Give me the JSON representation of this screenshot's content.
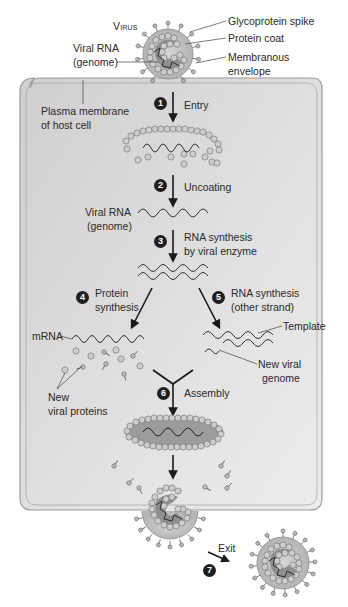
{
  "colors": {
    "cell_fill": "#d9d9d9",
    "cell_border": "#8e8e8e",
    "capsomere": "#c9c9c9",
    "capsomere_edge": "#7a7a7a",
    "envelope": "#bdbdbd",
    "core": "#8f8f8f",
    "arrow": "#1a1a1a",
    "badge": "#1f1f1f"
  },
  "virus_labels": {
    "virus": "Virus",
    "glycoprotein_spike": "Glycoprotein spike",
    "protein_coat": "Protein coat",
    "viral_rna_line1": "Viral RNA",
    "viral_rna_line2": "(genome)",
    "membranous_envelope_line1": "Membranous",
    "membranous_envelope_line2": "envelope"
  },
  "cell_labels": {
    "plasma_membrane_line1": "Plasma membrane",
    "plasma_membrane_line2": "of host cell"
  },
  "steps": [
    {
      "num": "1",
      "label_line1": "Entry",
      "label_line2": ""
    },
    {
      "num": "2",
      "label_line1": "Uncoating",
      "label_line2": ""
    },
    {
      "num": "3",
      "label_line1": "RNA synthesis",
      "label_line2": "by viral enzyme"
    },
    {
      "num": "4",
      "label_line1": "Protein",
      "label_line2": "synthesis"
    },
    {
      "num": "5",
      "label_line1": "RNA synthesis",
      "label_line2": "(other strand)"
    },
    {
      "num": "6",
      "label_line1": "Assembly",
      "label_line2": ""
    },
    {
      "num": "7",
      "label_line1": "Exit",
      "label_line2": ""
    }
  ],
  "inner_labels": {
    "viral_rna_line1": "Viral RNA",
    "viral_rna_line2": "(genome)",
    "mrna": "mRNA",
    "template": "Template",
    "new_viral_genome_line1": "New viral",
    "new_viral_genome_line2": "genome",
    "new_viral_proteins_line1": "New",
    "new_viral_proteins_line2": "viral proteins"
  }
}
